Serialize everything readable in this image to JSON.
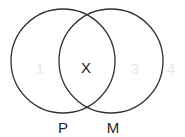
{
  "diagram": {
    "type": "venn",
    "sets": [
      {
        "name": "P",
        "label": "P"
      },
      {
        "name": "M",
        "label": "M"
      }
    ],
    "regions": {
      "only_p": "1",
      "intersection": "X",
      "only_m": "3",
      "outside": "4"
    },
    "colors": {
      "stroke": "#333333",
      "label": "#222222",
      "region_number": "#e6e6e6",
      "background": "#ffffff"
    }
  }
}
